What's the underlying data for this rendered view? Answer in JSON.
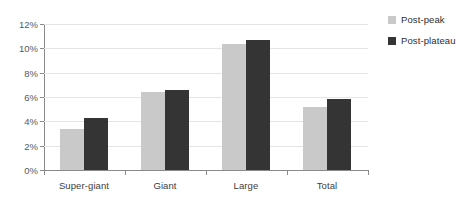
{
  "chart_data": {
    "type": "bar",
    "title": "",
    "subtitle": "",
    "xlabel": "",
    "ylabel": "",
    "categories": [
      "Super-giant",
      "Giant",
      "Large",
      "Total"
    ],
    "series": [
      {
        "name": "Post-peak",
        "color": "#c9c9c9",
        "values": [
          3.35,
          6.45,
          10.35,
          5.15
        ]
      },
      {
        "name": "Post-plateau",
        "color": "#343434",
        "values": [
          4.25,
          6.55,
          10.7,
          5.8
        ]
      }
    ],
    "ylim": [
      0,
      12
    ],
    "ytick_values": [
      0,
      2,
      4,
      6,
      8,
      10,
      12
    ],
    "ytick_labels": [
      "0%",
      "2%",
      "4%",
      "6%",
      "8%",
      "10%",
      "12%"
    ],
    "grid": true,
    "grid_axis": "y",
    "legend_position": "right-top",
    "value_unit": "%"
  },
  "legend": {
    "items": [
      {
        "label": "Post-peak",
        "color": "#c9c9c9"
      },
      {
        "label": "Post-plateau",
        "color": "#343434"
      }
    ]
  },
  "colors": {
    "background": "#ffffff",
    "axis": "#8a8a8a",
    "gridline": "#e4e4e4",
    "tick_text": "#5a5a5a",
    "category_text": "#3d3d3d",
    "series_light": "#c9c9c9",
    "series_dark": "#343434"
  }
}
